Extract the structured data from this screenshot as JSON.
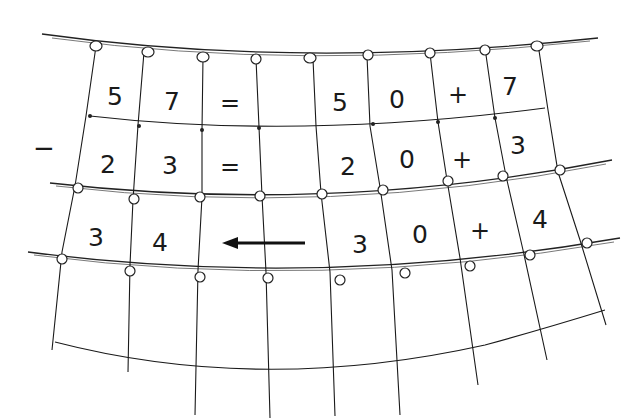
{
  "operator_left": "−",
  "rows": [
    {
      "cells": [
        "5",
        "7",
        "=",
        "",
        "5",
        "0",
        "+",
        "7"
      ]
    },
    {
      "cells": [
        "2",
        "3",
        "=",
        "",
        "2",
        "0",
        "+",
        "3"
      ]
    },
    {
      "cells": [
        "3",
        "4",
        "←",
        "",
        "3",
        "0",
        "+",
        "4"
      ]
    }
  ],
  "icons": [
    "arrow-left-icon",
    "knot-icon"
  ],
  "colors": {
    "ink": "#1a1a1a",
    "background": "#ffffff"
  }
}
